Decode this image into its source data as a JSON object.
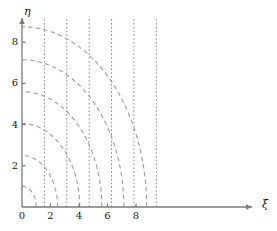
{
  "figure": {
    "title": "",
    "background": "#ffffff"
  },
  "axes": {
    "x_axis_label": "ξ",
    "y_axis_label": "η",
    "x_ticks": [
      {
        "value": 0,
        "label": "0"
      },
      {
        "value": 2,
        "label": "2"
      },
      {
        "value": 4,
        "label": "4"
      },
      {
        "value": 6,
        "label": "6"
      },
      {
        "value": 8,
        "label": "8"
      }
    ],
    "y_ticks": [
      {
        "value": 0,
        "label": "0"
      },
      {
        "value": 2,
        "label": "2"
      },
      {
        "value": 4,
        "label": "4"
      },
      {
        "value": 6,
        "label": "6"
      },
      {
        "value": 8,
        "label": "8"
      }
    ],
    "x_range": [
      0,
      9.6
    ],
    "y_range": [
      0,
      9.6
    ],
    "origin_label": "0",
    "arrow_on_x_axis": true,
    "arrow_on_y_axis": true
  },
  "colors": {
    "axis": "#7a7a7a",
    "solid_curve": "#9a9a9a",
    "dashed_arc": "#a3a3a3",
    "dotted_asymptote": "#8c8c8c",
    "text": "#1a1a1a"
  },
  "chart_data": {
    "type": "line",
    "title": "",
    "xlabel": "ξ",
    "ylabel": "η",
    "xlim": [
      0,
      9.6
    ],
    "ylim": [
      0,
      9.6
    ],
    "grid": false,
    "legend": "none",
    "series": [
      {
        "name": "tan-curve-1",
        "style": "solid",
        "color": "#9a9a9a",
        "equation": "eta = xi * tan(xi)",
        "branch_start": 1.571,
        "branch_end": 3.0,
        "x": [
          1.6,
          1.75,
          1.95,
          2.15,
          2.35,
          2.55,
          2.72,
          2.85,
          2.95,
          3.02
        ],
        "y": [
          0.05,
          0.46,
          1.03,
          1.7,
          2.53,
          3.59,
          4.79,
          6.05,
          7.4,
          8.9
        ]
      },
      {
        "name": "tan-curve-2",
        "style": "solid",
        "color": "#9a9a9a",
        "equation": "eta = xi * tan(xi)",
        "branch_start": 4.712,
        "branch_end": 6.1,
        "x": [
          4.75,
          4.95,
          5.15,
          5.35,
          5.55,
          5.72,
          5.85,
          5.95,
          6.02,
          6.08
        ],
        "y": [
          0.1,
          0.85,
          1.75,
          2.7,
          3.8,
          5.0,
          6.1,
          7.2,
          8.2,
          9.0
        ]
      },
      {
        "name": "tan-curve-3",
        "style": "solid",
        "color": "#9a9a9a",
        "equation": "eta = xi * tan(xi)",
        "branch_start": 7.854,
        "branch_end": 9.2,
        "x": [
          7.88,
          8.05,
          8.25,
          8.45,
          8.62,
          8.78,
          8.9,
          9.0,
          9.08,
          9.14
        ],
        "y": [
          0.1,
          0.8,
          1.8,
          2.9,
          4.05,
          5.3,
          6.45,
          7.5,
          8.4,
          9.05
        ]
      },
      {
        "name": "circle-arc-1",
        "style": "dashed",
        "color": "#a3a3a3",
        "equation": "xi^2 + eta^2 = z0^2",
        "radius": 1.0,
        "y_intercept": 1.0,
        "x_intercept": 1.0
      },
      {
        "name": "circle-arc-2",
        "style": "dashed",
        "color": "#a3a3a3",
        "equation": "xi^2 + eta^2 = z0^2",
        "radius": 2.5,
        "y_intercept": 2.5,
        "x_intercept": 2.5
      },
      {
        "name": "circle-arc-3",
        "style": "dashed",
        "color": "#a3a3a3",
        "equation": "xi^2 + eta^2 = z0^2",
        "radius": 4.05,
        "y_intercept": 4.05,
        "x_intercept": 4.05
      },
      {
        "name": "circle-arc-4",
        "style": "dashed",
        "color": "#a3a3a3",
        "equation": "xi^2 + eta^2 = z0^2",
        "radius": 5.6,
        "y_intercept": 5.6,
        "x_intercept": 5.6
      },
      {
        "name": "circle-arc-5",
        "style": "dashed",
        "color": "#a3a3a3",
        "equation": "xi^2 + eta^2 = z0^2",
        "radius": 7.15,
        "y_intercept": 7.15,
        "x_intercept": 7.15
      },
      {
        "name": "circle-arc-6",
        "style": "dashed",
        "color": "#a3a3a3",
        "equation": "xi^2 + eta^2 = z0^2",
        "radius": 8.75,
        "y_intercept": 8.75,
        "x_intercept": 8.75
      }
    ],
    "asymptotes": [
      {
        "name": "asymptote-1",
        "x": 1.571,
        "style": "dotted",
        "label": "pi/2"
      },
      {
        "name": "asymptote-2",
        "x": 3.142,
        "style": "dotted",
        "label": "pi"
      },
      {
        "name": "asymptote-3",
        "x": 4.712,
        "style": "dotted",
        "label": "3pi/2"
      },
      {
        "name": "asymptote-4",
        "x": 6.283,
        "style": "dotted",
        "label": "2pi"
      },
      {
        "name": "asymptote-5",
        "x": 7.854,
        "style": "dotted",
        "label": "5pi/2"
      },
      {
        "name": "asymptote-6",
        "x": 9.425,
        "style": "dotted",
        "label": "3pi"
      }
    ]
  }
}
